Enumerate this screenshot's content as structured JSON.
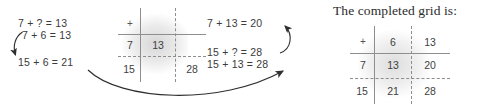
{
  "heading": "The completed grid is:",
  "left_equations": {
    "line1": "7 + ? = 13",
    "line2": "7 + 6 = 13",
    "line3": "15 + 6 = 21"
  },
  "right_equations": {
    "line1": "7 + 13 = 20",
    "line2": "15 + ? = 28",
    "line3": "15 + 13 = 28"
  },
  "working_grid": {
    "corner": "+",
    "col_header_1": "",
    "col_header_2": "",
    "row_1": {
      "label": "7",
      "c1": "13",
      "c2": ""
    },
    "row_2": {
      "label": "15",
      "c1": "",
      "c2": "28"
    }
  },
  "completed_grid": {
    "corner": "+",
    "col_header_1": "6",
    "col_header_2": "13",
    "row_1": {
      "label": "7",
      "c1": "13",
      "c2": "20"
    },
    "row_2": {
      "label": "15",
      "c1": "21",
      "c2": "28"
    }
  },
  "colors": {
    "text": "#3b3b3b",
    "rule": "#8e8e8e",
    "arrow": "#2f2f2f",
    "background": "#ffffff"
  },
  "arrows": {
    "left_hook": "curved-arrow-down-left",
    "bottom_sweep": "curved-arrow-left-to-right",
    "right_hook": "curved-arrow-up-left"
  }
}
